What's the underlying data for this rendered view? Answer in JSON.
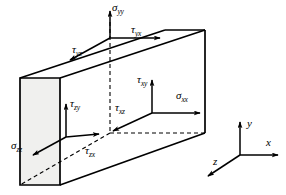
{
  "figure": {
    "type": "3d-stress-element-diagram",
    "colors": {
      "stroke": "#000000",
      "face_fill": "#f0f0ee",
      "background": "#ffffff"
    },
    "cube": {
      "front_face_shaded": true,
      "hidden_edges_dashed": true
    },
    "stress_labels": [
      {
        "id": "sigma-yy",
        "symbol": "σ",
        "sub": "yy",
        "face": "top",
        "direction": "up"
      },
      {
        "id": "tau-yx",
        "symbol": "τ",
        "sub": "yx",
        "face": "top",
        "direction": "right"
      },
      {
        "id": "tau-yz",
        "symbol": "τ",
        "sub": "yz",
        "face": "top",
        "direction": "down-left"
      },
      {
        "id": "tau-xy",
        "symbol": "τ",
        "sub": "xy",
        "face": "right",
        "direction": "up"
      },
      {
        "id": "sigma-xx",
        "symbol": "σ",
        "sub": "xx",
        "face": "right",
        "direction": "right"
      },
      {
        "id": "tau-xz",
        "symbol": "τ",
        "sub": "xz",
        "face": "right",
        "direction": "down-left"
      },
      {
        "id": "tau-zy",
        "symbol": "τ",
        "sub": "zy",
        "face": "front",
        "direction": "up"
      },
      {
        "id": "tau-zx",
        "symbol": "τ",
        "sub": "zx",
        "face": "front",
        "direction": "right"
      },
      {
        "id": "sigma-zz",
        "symbol": "σ",
        "sub": "zz",
        "face": "front",
        "direction": "down-left"
      }
    ],
    "axes": {
      "y": {
        "label": "y",
        "direction": "up"
      },
      "x": {
        "label": "x",
        "direction": "right"
      },
      "z": {
        "label": "z",
        "direction": "down-left"
      }
    }
  }
}
